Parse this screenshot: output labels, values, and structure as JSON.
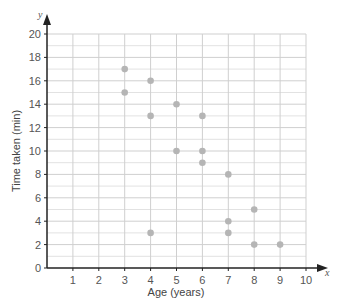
{
  "chart_data": {
    "type": "scatter",
    "title": "",
    "xlabel": "Age (years)",
    "ylabel": "Time taken (min)",
    "x_axis_var": "x",
    "y_axis_var": "y",
    "xlim": [
      0,
      10
    ],
    "ylim": [
      0,
      20
    ],
    "x_ticks": [
      1,
      2,
      3,
      4,
      5,
      6,
      7,
      8,
      9,
      10
    ],
    "y_ticks": [
      0,
      2,
      4,
      6,
      8,
      10,
      12,
      14,
      16,
      18,
      20
    ],
    "grid": true,
    "point_color": "#b5b5b5",
    "points": [
      {
        "x": 3,
        "y": 17
      },
      {
        "x": 3,
        "y": 15
      },
      {
        "x": 4,
        "y": 16
      },
      {
        "x": 4,
        "y": 13
      },
      {
        "x": 4,
        "y": 3
      },
      {
        "x": 5,
        "y": 14
      },
      {
        "x": 5,
        "y": 10
      },
      {
        "x": 6,
        "y": 13
      },
      {
        "x": 6,
        "y": 10
      },
      {
        "x": 6,
        "y": 9
      },
      {
        "x": 7,
        "y": 8
      },
      {
        "x": 7,
        "y": 4
      },
      {
        "x": 7,
        "y": 3
      },
      {
        "x": 8,
        "y": 5
      },
      {
        "x": 8,
        "y": 2
      },
      {
        "x": 9,
        "y": 2
      }
    ]
  }
}
